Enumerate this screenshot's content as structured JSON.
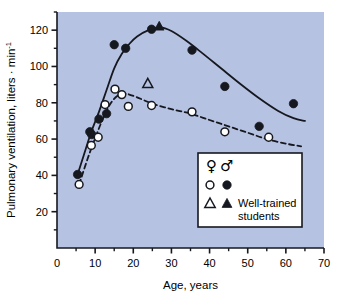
{
  "chart_data": {
    "type": "scatter",
    "title": "",
    "xlabel": "Age, years",
    "ylabel": "Pulmonary ventilation, liters · min",
    "ylabel_exponent": "-1",
    "xlim": [
      0,
      70
    ],
    "ylim": [
      0,
      130
    ],
    "xticks": [
      0,
      10,
      20,
      30,
      40,
      50,
      60,
      70
    ],
    "xminor_ticks": [
      5,
      15,
      25,
      35,
      45,
      55,
      65
    ],
    "yticks": [
      20,
      40,
      60,
      80,
      100,
      120
    ],
    "yminor_ticks": [
      10,
      30,
      50,
      70,
      90,
      110,
      130
    ],
    "grid": false,
    "plot_background": "#b6c2e2",
    "legend_position": "bottom-right",
    "series": [
      {
        "name": "Male",
        "marker": "filled-circle",
        "line": "solid",
        "points": [
          {
            "x": 5.4,
            "y": 40.5
          },
          {
            "x": 8.6,
            "y": 64.0
          },
          {
            "x": 9.1,
            "y": 62.5
          },
          {
            "x": 11.0,
            "y": 71.0
          },
          {
            "x": 13.0,
            "y": 74.0
          },
          {
            "x": 15.0,
            "y": 112.0
          },
          {
            "x": 18.0,
            "y": 110.0
          },
          {
            "x": 24.8,
            "y": 120.5
          },
          {
            "x": 35.4,
            "y": 109.0
          },
          {
            "x": 44.0,
            "y": 89.0
          },
          {
            "x": 53.0,
            "y": 67.0
          },
          {
            "x": 62.0,
            "y": 79.5
          }
        ]
      },
      {
        "name": "Female",
        "marker": "open-circle",
        "line": "dashed",
        "points": [
          {
            "x": 5.8,
            "y": 35.0
          },
          {
            "x": 9.0,
            "y": 56.5
          },
          {
            "x": 10.8,
            "y": 61.0
          },
          {
            "x": 12.6,
            "y": 79.0
          },
          {
            "x": 15.2,
            "y": 87.5
          },
          {
            "x": 17.0,
            "y": 84.5
          },
          {
            "x": 18.7,
            "y": 78.0
          },
          {
            "x": 24.8,
            "y": 78.5
          },
          {
            "x": 35.4,
            "y": 75.0
          },
          {
            "x": 44.0,
            "y": 64.0
          },
          {
            "x": 55.5,
            "y": 61.0
          }
        ]
      },
      {
        "name": "Well-trained students, female",
        "marker": "open-triangle",
        "line": "none",
        "points": [
          {
            "x": 23.8,
            "y": 90.5
          }
        ]
      },
      {
        "name": "Well-trained students, male",
        "marker": "filled-triangle",
        "line": "none",
        "points": [
          {
            "x": 26.8,
            "y": 122.0
          }
        ]
      }
    ],
    "fit_curves": [
      {
        "name": "male-fit",
        "style": "solid",
        "points": [
          {
            "x": 5.4,
            "y": 40.5
          },
          {
            "x": 7.0,
            "y": 51.0
          },
          {
            "x": 9.0,
            "y": 64.0
          },
          {
            "x": 11.0,
            "y": 75.0
          },
          {
            "x": 13.0,
            "y": 87.0
          },
          {
            "x": 15.0,
            "y": 99.0
          },
          {
            "x": 17.0,
            "y": 107.0
          },
          {
            "x": 19.0,
            "y": 112.5
          },
          {
            "x": 21.0,
            "y": 116.5
          },
          {
            "x": 24.0,
            "y": 120.0
          },
          {
            "x": 27.0,
            "y": 121.5
          },
          {
            "x": 30.0,
            "y": 119.5
          },
          {
            "x": 34.0,
            "y": 114.0
          },
          {
            "x": 38.0,
            "y": 107.5
          },
          {
            "x": 43.0,
            "y": 99.0
          },
          {
            "x": 48.0,
            "y": 90.5
          },
          {
            "x": 53.0,
            "y": 82.5
          },
          {
            "x": 58.0,
            "y": 75.5
          },
          {
            "x": 62.0,
            "y": 71.5
          },
          {
            "x": 65.0,
            "y": 70.0
          }
        ]
      },
      {
        "name": "female-fit",
        "style": "dashed",
        "points": [
          {
            "x": 5.8,
            "y": 35.0
          },
          {
            "x": 8.0,
            "y": 49.0
          },
          {
            "x": 10.0,
            "y": 60.5
          },
          {
            "x": 12.0,
            "y": 71.0
          },
          {
            "x": 14.0,
            "y": 79.5
          },
          {
            "x": 16.0,
            "y": 84.0
          },
          {
            "x": 18.0,
            "y": 85.0
          },
          {
            "x": 21.0,
            "y": 83.0
          },
          {
            "x": 25.0,
            "y": 79.5
          },
          {
            "x": 30.0,
            "y": 76.5
          },
          {
            "x": 35.0,
            "y": 74.0
          },
          {
            "x": 40.0,
            "y": 70.5
          },
          {
            "x": 45.0,
            "y": 67.0
          },
          {
            "x": 50.0,
            "y": 63.5
          },
          {
            "x": 55.0,
            "y": 60.0
          },
          {
            "x": 60.0,
            "y": 57.5
          },
          {
            "x": 64.0,
            "y": 56.0
          }
        ]
      }
    ],
    "legend": {
      "female_symbol": "♀",
      "male_symbol": "♂",
      "row_circle_open": "○",
      "row_circle_filled": "●",
      "row_triangle_open": "△",
      "row_triangle_filled": "▲",
      "trained_label_line1": "Well-trained",
      "trained_label_line2": "students"
    }
  },
  "colors": {
    "plot_bg": "#b6c2e2",
    "ink": "#16181f",
    "marker_fill": "#16181f",
    "marker_open": "#ffffff",
    "legend_bg": "#ffffff",
    "page_bg": "#ffffff"
  }
}
